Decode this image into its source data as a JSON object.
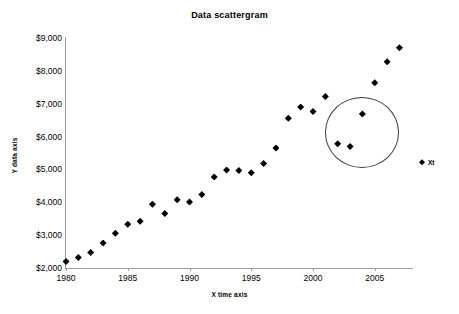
{
  "chart_data": {
    "type": "scatter",
    "title": "Data scattergram",
    "xlabel": "X time axis",
    "ylabel": "Y data axis",
    "xlim": [
      1980,
      2008
    ],
    "ylim": [
      2000,
      9000
    ],
    "grid": false,
    "legend_position": "right",
    "x_tick_labels": [
      "1980",
      "1985",
      "1990",
      "1995",
      "2000",
      "2005"
    ],
    "x_ticks": [
      1980,
      1985,
      1990,
      1995,
      2000,
      2005
    ],
    "y_tick_labels": [
      "$2,000",
      "$3,000",
      "$4,000",
      "$5,000",
      "$6,000",
      "$7,000",
      "$8,000",
      "$9,000"
    ],
    "y_ticks": [
      2000,
      3000,
      4000,
      5000,
      6000,
      7000,
      8000,
      9000
    ],
    "series": [
      {
        "name": "Xt",
        "marker": "diamond",
        "color": "#000000",
        "x": [
          1980,
          1981,
          1982,
          1983,
          1984,
          1985,
          1986,
          1987,
          1988,
          1989,
          1990,
          1991,
          1992,
          1993,
          1994,
          1995,
          1996,
          1997,
          1998,
          1999,
          2000,
          2001,
          2002,
          2003,
          2004,
          2005,
          2006,
          2007
        ],
        "values": [
          2200,
          2320,
          2470,
          2760,
          3060,
          3330,
          3420,
          3940,
          3660,
          4080,
          4010,
          4240,
          4770,
          4980,
          4970,
          4900,
          5180,
          5650,
          6560,
          6900,
          6760,
          7220,
          5780,
          5700,
          6690,
          7640,
          8280,
          8700
        ]
      }
    ],
    "annotations": [
      {
        "type": "circle",
        "label": "outlier-highlight-circle",
        "center_x": 2003.95,
        "center_y": 6120,
        "radius_x_years": 3.0,
        "radius_y_value": 1070,
        "encircled_points": [
          {
            "x": 2002,
            "y": 5780
          },
          {
            "x": 2003,
            "y": 5700
          },
          {
            "x": 2004,
            "y": 6690
          }
        ]
      }
    ]
  },
  "legend": {
    "label": "Xt",
    "marker_name": "diamond-marker-icon"
  }
}
